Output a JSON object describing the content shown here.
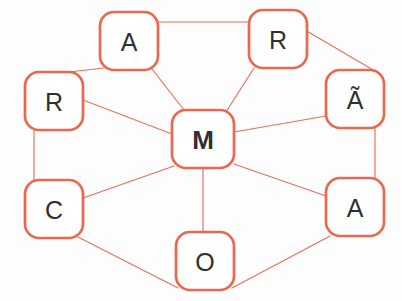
{
  "diagram": {
    "canvas": {
      "width": 402,
      "height": 301,
      "background": "#fdfdfd"
    },
    "style": {
      "node_stroke": "#e9684f",
      "node_fill": "#ffffff",
      "edge_stroke": "#e4705c",
      "label_color": "#2f2f2f"
    },
    "nodes": [
      {
        "id": "a_top",
        "label": "A",
        "x": 100,
        "y": 12,
        "w": 58,
        "h": 58,
        "r": 14,
        "bold": false
      },
      {
        "id": "r_top",
        "label": "R",
        "x": 249,
        "y": 10,
        "w": 58,
        "h": 58,
        "r": 14,
        "bold": false
      },
      {
        "id": "r_left",
        "label": "R",
        "x": 25,
        "y": 72,
        "w": 58,
        "h": 58,
        "r": 14,
        "bold": false
      },
      {
        "id": "a_tilde",
        "label": "Ã",
        "x": 326,
        "y": 70,
        "w": 58,
        "h": 58,
        "r": 14,
        "bold": false
      },
      {
        "id": "m_center",
        "label": "M",
        "x": 172,
        "y": 110,
        "w": 62,
        "h": 58,
        "r": 14,
        "bold": true
      },
      {
        "id": "c_left",
        "label": "C",
        "x": 25,
        "y": 180,
        "w": 58,
        "h": 58,
        "r": 14,
        "bold": false
      },
      {
        "id": "a_right",
        "label": "A",
        "x": 326,
        "y": 178,
        "w": 58,
        "h": 58,
        "r": 14,
        "bold": false
      },
      {
        "id": "o_bottom",
        "label": "O",
        "x": 176,
        "y": 232,
        "w": 58,
        "h": 58,
        "r": 14,
        "bold": false
      }
    ],
    "edges": [
      {
        "id": "e-a_top-r_top",
        "from": "a_top",
        "to": "r_top",
        "x1": 158,
        "y1": 22,
        "x2": 249,
        "y2": 22
      },
      {
        "id": "e-a_top-r_left",
        "from": "a_top",
        "to": "r_left",
        "x1": 104,
        "y1": 68,
        "x2": 34,
        "y2": 76
      },
      {
        "id": "e-a_top-m",
        "from": "a_top",
        "to": "m_center",
        "x1": 152,
        "y1": 69,
        "x2": 184,
        "y2": 110
      },
      {
        "id": "e-r_top-m",
        "from": "r_top",
        "to": "m_center",
        "x1": 254,
        "y1": 68,
        "x2": 226,
        "y2": 112
      },
      {
        "id": "e-r_top-a_tilde",
        "from": "r_top",
        "to": "a_tilde",
        "x1": 305,
        "y1": 30,
        "x2": 380,
        "y2": 74
      },
      {
        "id": "e-r_left-m",
        "from": "r_left",
        "to": "m_center",
        "x1": 83,
        "y1": 100,
        "x2": 172,
        "y2": 134
      },
      {
        "id": "e-r_left-c",
        "from": "r_left",
        "to": "c_left",
        "x1": 34,
        "y1": 130,
        "x2": 34,
        "y2": 180
      },
      {
        "id": "e-a_tilde-m",
        "from": "a_tilde",
        "to": "m_center",
        "x1": 326,
        "y1": 116,
        "x2": 234,
        "y2": 132
      },
      {
        "id": "e-a_tilde-a_right",
        "from": "a_tilde",
        "to": "a_right",
        "x1": 375,
        "y1": 128,
        "x2": 375,
        "y2": 178
      },
      {
        "id": "e-m-c",
        "from": "m_center",
        "to": "c_left",
        "x1": 174,
        "y1": 166,
        "x2": 83,
        "y2": 198
      },
      {
        "id": "e-m-a_right",
        "from": "m_center",
        "to": "a_right",
        "x1": 234,
        "y1": 164,
        "x2": 326,
        "y2": 196
      },
      {
        "id": "e-m-o",
        "from": "m_center",
        "to": "o_bottom",
        "x1": 203,
        "y1": 168,
        "x2": 203,
        "y2": 232
      },
      {
        "id": "e-c-o",
        "from": "c_left",
        "to": "o_bottom",
        "x1": 78,
        "y1": 237,
        "x2": 178,
        "y2": 288
      },
      {
        "id": "e-o-a_right",
        "from": "o_bottom",
        "to": "a_right",
        "x1": 232,
        "y1": 288,
        "x2": 330,
        "y2": 236
      }
    ]
  }
}
